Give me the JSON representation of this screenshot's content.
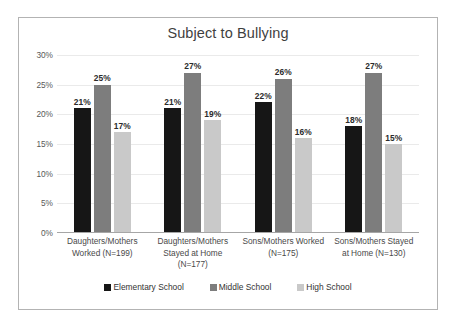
{
  "chart_data": {
    "type": "bar",
    "title": "Subject to Bullying",
    "xlabel": "",
    "ylabel": "",
    "ylim": [
      0,
      30
    ],
    "ytick_labels": [
      "30%",
      "25%",
      "20%",
      "15%",
      "10%",
      "5%",
      "0%"
    ],
    "ytick_values": [
      30,
      25,
      20,
      15,
      10,
      5,
      0
    ],
    "grid": true,
    "legend_position": "bottom",
    "categories": [
      "Daughters/Mothers Worked (N=199)",
      "Daughters/Mothers Stayed at Home (N=177)",
      "Sons/Mothers Worked (N=175)",
      "Sons/Mothers Stayed at Home (N=130)"
    ],
    "category_lines": [
      [
        "Daughters/Mothers",
        "Worked (N=199)"
      ],
      [
        "Daughters/Mothers",
        "Stayed at Home",
        "(N=177)"
      ],
      [
        "Sons/Mothers Worked",
        "(N=175)"
      ],
      [
        "Sons/Mothers Stayed",
        "at Home (N=130)"
      ]
    ],
    "series": [
      {
        "name": "Elementary School",
        "color": "#161616",
        "values": [
          21,
          21,
          22,
          18
        ],
        "labels": [
          "21%",
          "21%",
          "22%",
          "18%"
        ]
      },
      {
        "name": "Middle School",
        "color": "#7d7d7d",
        "values": [
          25,
          27,
          26,
          27
        ],
        "labels": [
          "25%",
          "27%",
          "26%",
          "27%"
        ]
      },
      {
        "name": "High School",
        "color": "#c9c9c9",
        "values": [
          17,
          19,
          16,
          15
        ],
        "labels": [
          "17%",
          "19%",
          "16%",
          "15%"
        ]
      }
    ]
  }
}
